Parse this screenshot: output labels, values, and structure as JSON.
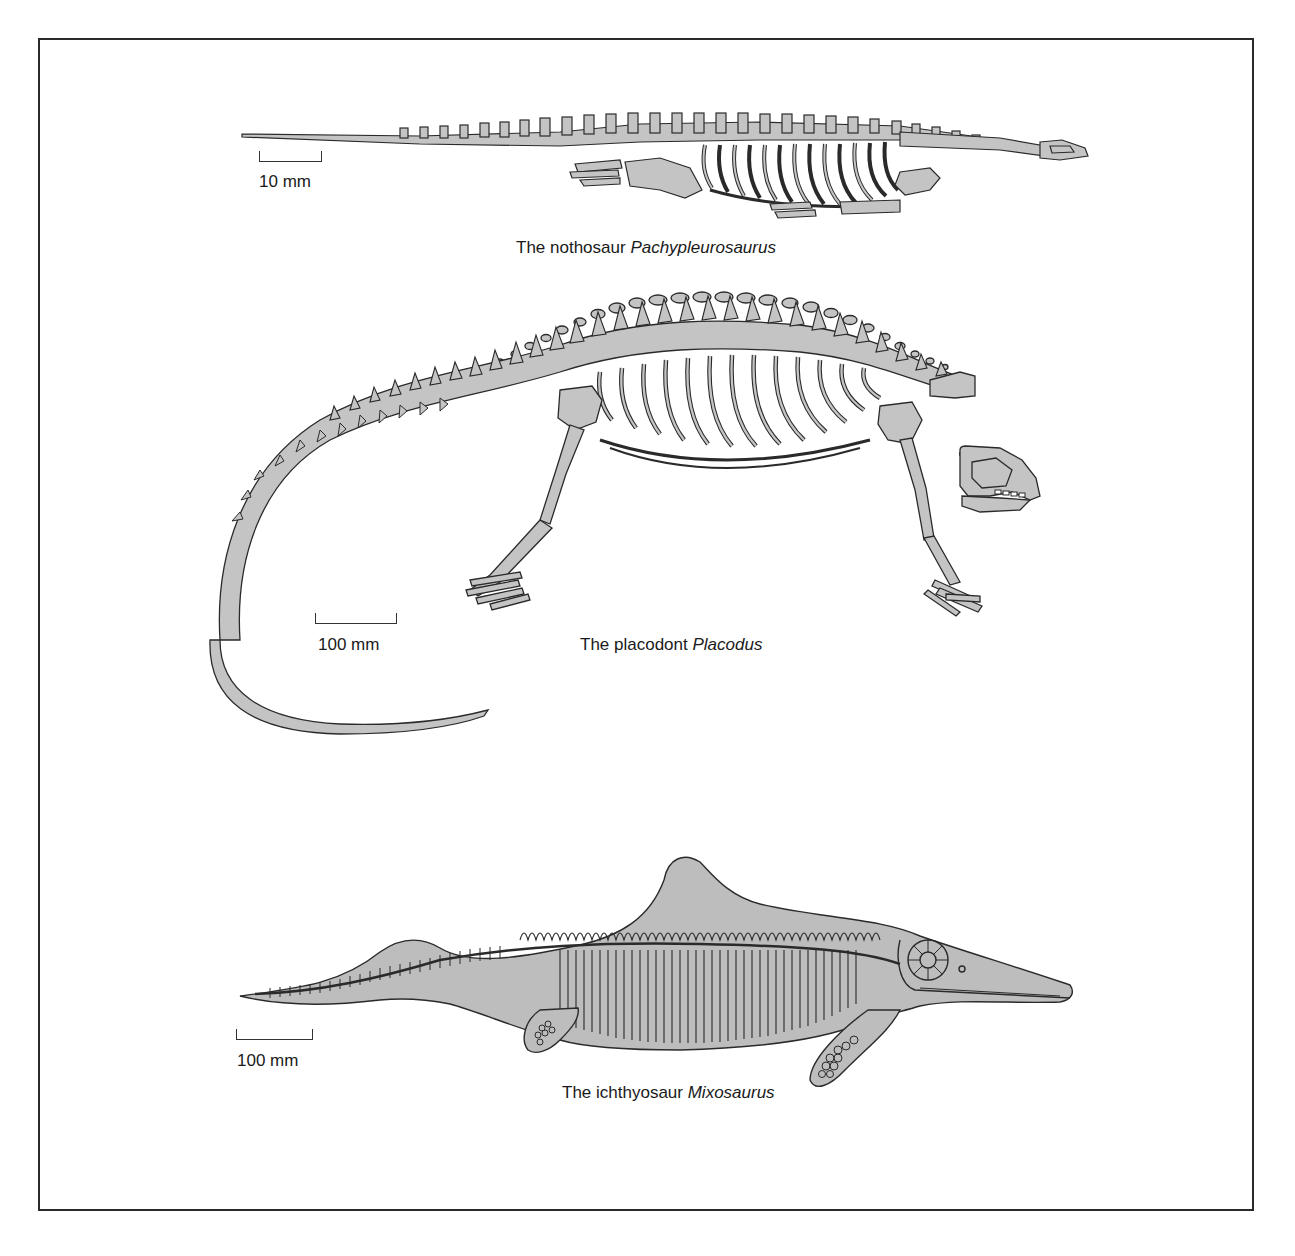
{
  "figure": {
    "panels": [
      {
        "id": "nothosaur",
        "caption_prefix": "The nothosaur",
        "caption_genus": "Pachypleurosaurus",
        "scale_label": "10 mm"
      },
      {
        "id": "placodont",
        "caption_prefix": "The placodont",
        "caption_genus": "Placodus",
        "scale_label": "100 mm"
      },
      {
        "id": "ichthyosaur",
        "caption_prefix": "The ichthyosaur",
        "caption_genus": "Mixosaurus",
        "scale_label": "100 mm"
      }
    ],
    "colors": {
      "bone_fill": "#c4c4c4",
      "outline": "#2a2a2a",
      "body_fill": "#bdbdbd",
      "frame": "#2a2a2a"
    }
  }
}
